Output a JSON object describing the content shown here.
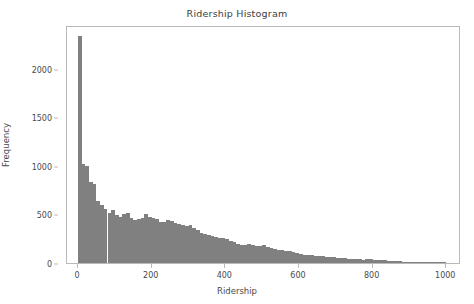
{
  "chart_data": {
    "type": "bar",
    "title": "Ridership Histogram",
    "xlabel": "Ridership",
    "ylabel": "Frequency",
    "xlim": [
      -30,
      1040
    ],
    "ylim": [
      0,
      2450
    ],
    "xticks": [
      0,
      200,
      400,
      600,
      800,
      1000
    ],
    "xtick_labels": [
      "0",
      "200",
      "400",
      "600",
      "800",
      "1000"
    ],
    "yticks": [
      0,
      500,
      1000,
      1500,
      2000
    ],
    "ytick_labels": [
      "0",
      "500",
      "1000",
      "1500",
      "2000"
    ],
    "grid": false,
    "legend": false,
    "bar_color": "#808080",
    "bin_width": 10,
    "bin_starts": [
      0,
      10,
      20,
      30,
      40,
      50,
      60,
      70,
      80,
      90,
      100,
      110,
      120,
      130,
      140,
      150,
      160,
      170,
      180,
      190,
      200,
      210,
      220,
      230,
      240,
      250,
      260,
      270,
      280,
      290,
      300,
      310,
      320,
      330,
      340,
      350,
      360,
      370,
      380,
      390,
      400,
      410,
      420,
      430,
      440,
      450,
      460,
      470,
      480,
      490,
      500,
      510,
      520,
      530,
      540,
      550,
      560,
      570,
      580,
      590,
      600,
      610,
      620,
      630,
      640,
      650,
      660,
      670,
      680,
      690,
      700,
      710,
      720,
      730,
      740,
      750,
      760,
      770,
      780,
      790,
      800,
      810,
      820,
      830,
      840,
      850,
      860,
      870,
      880,
      890,
      900,
      910,
      920,
      930,
      940,
      950,
      960,
      970,
      980,
      990
    ],
    "values": [
      2340,
      1015,
      1000,
      835,
      810,
      640,
      600,
      560,
      520,
      545,
      495,
      470,
      500,
      510,
      460,
      445,
      455,
      465,
      500,
      470,
      465,
      455,
      420,
      420,
      445,
      435,
      410,
      400,
      395,
      385,
      390,
      360,
      340,
      310,
      295,
      290,
      275,
      270,
      260,
      255,
      250,
      230,
      215,
      195,
      185,
      190,
      195,
      185,
      175,
      180,
      185,
      160,
      150,
      140,
      135,
      130,
      125,
      120,
      110,
      105,
      90,
      85,
      80,
      80,
      75,
      75,
      70,
      65,
      65,
      60,
      55,
      50,
      50,
      45,
      42,
      40,
      38,
      36,
      42,
      38,
      30,
      28,
      34,
      30,
      24,
      20,
      18,
      16,
      14,
      12,
      8,
      6,
      5,
      4,
      4,
      3,
      3,
      2,
      2,
      2
    ],
    "summary": {
      "peak_bin": "0-10",
      "peak_value": 2340,
      "shape": "right-skewed long tail",
      "n_bins": 100
    }
  }
}
